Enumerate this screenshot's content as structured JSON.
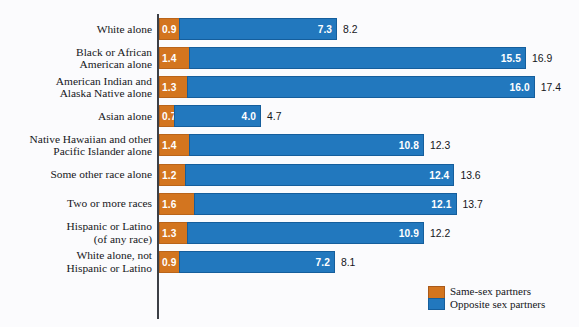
{
  "chart_data": {
    "type": "bar",
    "orientation": "horizontal",
    "stacked": true,
    "title": "",
    "subtitle": "",
    "xlabel": "",
    "ylabel": "",
    "xlim": [
      0,
      19
    ],
    "grid": false,
    "legend_position": "bottom-right",
    "categories": [
      "White alone",
      "Black or African\nAmerican alone",
      "American Indian and\nAlaska Native alone",
      "Asian alone",
      "Native Hawaiian and other\nPacific Islander alone",
      "Some other race alone",
      "Two or more races",
      "Hispanic or Latino\n(of any race)",
      "White alone, not\nHispanic or Latino"
    ],
    "series": [
      {
        "name": "Same-sex partners",
        "color": "#d3751f",
        "values": [
          0.9,
          1.4,
          1.3,
          0.7,
          1.4,
          1.2,
          1.6,
          1.3,
          0.9
        ]
      },
      {
        "name": "Opposite sex partners",
        "color": "#2278be",
        "values": [
          7.3,
          15.5,
          16.0,
          4.0,
          10.8,
          12.4,
          12.1,
          10.9,
          7.2
        ]
      }
    ],
    "totals": [
      8.2,
      16.9,
      17.4,
      4.7,
      12.3,
      13.6,
      13.7,
      12.2,
      8.1
    ],
    "value_labels": {
      "same": [
        "0.9",
        "1.4",
        "1.3",
        "0.7",
        "1.4",
        "1.2",
        "1.6",
        "1.3",
        "0.9"
      ],
      "opposite": [
        "7.3",
        "15.5",
        "16.0",
        "4.0",
        "10.8",
        "12.4",
        "12.1",
        "10.9",
        "7.2"
      ],
      "total": [
        "8.2",
        "16.9",
        "17.4",
        "4.7",
        "12.3",
        "13.6",
        "13.7",
        "12.2",
        "8.1"
      ]
    }
  },
  "legend": {
    "items": [
      {
        "label": "Same-sex partners",
        "color": "#d3751f"
      },
      {
        "label": "Opposite sex partners",
        "color": "#2278be"
      }
    ]
  },
  "colors": {
    "same_sex": "#d3751f",
    "opposite_sex": "#2278be",
    "background": "#fbfbfd",
    "axis": "#3c3f46",
    "text": "#15161a"
  }
}
